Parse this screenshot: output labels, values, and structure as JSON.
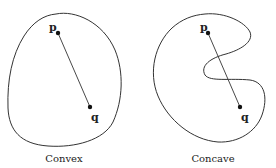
{
  "panels": [
    {
      "title": "Convex",
      "point_a": "p",
      "point_b": "q"
    },
    {
      "title": "Concave",
      "point_a": "p",
      "point_b": "q"
    }
  ],
  "colors": {
    "stroke": "#333333",
    "text": "#222222",
    "background": "#ffffff"
  }
}
